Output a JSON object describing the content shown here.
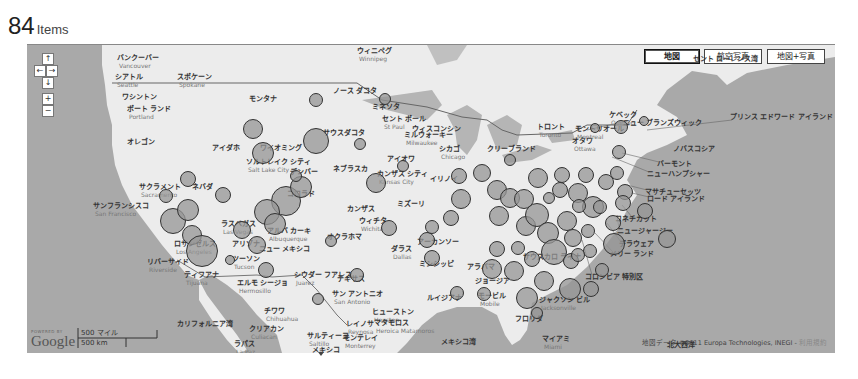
{
  "header": {
    "count": "84",
    "unit": "Items"
  },
  "map_controls": {
    "pan_up": "↑",
    "pan_left": "←",
    "pan_right": "→",
    "pan_down": "↓",
    "zoom_in": "+",
    "zoom_out": "−"
  },
  "map_types": [
    {
      "label": "地図",
      "active": true
    },
    {
      "label": "航空写真",
      "active": false
    },
    {
      "label": "地図+写真",
      "active": false
    }
  ],
  "labels": [
    {
      "text": "ウィニペグ",
      "sub": "Winnipeg",
      "x": 330,
      "y": 2
    },
    {
      "text": "バンクーバー",
      "sub": "Vancouver",
      "x": 90,
      "y": 9
    },
    {
      "text": "シアトル",
      "sub": "Seattle",
      "x": 88,
      "y": 28
    },
    {
      "text": "スポケーン",
      "sub": "Spokane",
      "x": 150,
      "y": 28
    },
    {
      "text": "ワシントン",
      "x": 95,
      "y": 48
    },
    {
      "text": "ポート ランド",
      "sub": "Portland",
      "x": 100,
      "y": 60
    },
    {
      "text": "オレゴン",
      "x": 100,
      "y": 93
    },
    {
      "text": "モンタナ",
      "x": 222,
      "y": 50
    },
    {
      "text": "アイダホ",
      "x": 185,
      "y": 99
    },
    {
      "text": "ワイオミング",
      "x": 233,
      "y": 99
    },
    {
      "text": "ノース ダコタ",
      "x": 306,
      "y": 42
    },
    {
      "text": "サウスダコタ",
      "x": 296,
      "y": 84
    },
    {
      "text": "ミネソタ",
      "x": 345,
      "y": 58
    },
    {
      "text": "セント ポール",
      "sub": "St Paul",
      "x": 355,
      "y": 70
    },
    {
      "text": "ミルウォーキー",
      "sub": "Milwaukee",
      "x": 377,
      "y": 86
    },
    {
      "text": "ウィスコンシン",
      "x": 385,
      "y": 80
    },
    {
      "text": "アイオワ",
      "x": 360,
      "y": 110
    },
    {
      "text": "ネブラスカ",
      "x": 306,
      "y": 120
    },
    {
      "text": "ソルトレイク シティ",
      "sub": "Salt Lake City",
      "x": 219,
      "y": 113
    },
    {
      "text": "デンバー",
      "x": 263,
      "y": 123
    },
    {
      "text": "コロラド",
      "x": 260,
      "y": 145
    },
    {
      "text": "ネバダ",
      "x": 165,
      "y": 138
    },
    {
      "text": "サクラメント",
      "sub": "Sacramento",
      "x": 112,
      "y": 138
    },
    {
      "text": "サンフランシスコ",
      "sub": "San Francisco",
      "x": 66,
      "y": 157
    },
    {
      "text": "カンザス シティ",
      "sub": "Kansas City",
      "x": 350,
      "y": 125
    },
    {
      "text": "カンザス",
      "x": 320,
      "y": 160
    },
    {
      "text": "ウィチタ",
      "sub": "Wichita",
      "x": 332,
      "y": 172
    },
    {
      "text": "ミズーリ",
      "x": 370,
      "y": 155
    },
    {
      "text": "イリノイ",
      "x": 403,
      "y": 130
    },
    {
      "text": "シカゴ",
      "sub": "Chicago",
      "x": 412,
      "y": 100
    },
    {
      "text": "クリーブランド",
      "x": 460,
      "y": 100
    },
    {
      "text": "トロント",
      "sub": "Toronto",
      "x": 510,
      "y": 78
    },
    {
      "text": "オタワ",
      "sub": "Ottawa",
      "x": 545,
      "y": 92
    },
    {
      "text": "モントリオール",
      "sub": "Montreal",
      "x": 548,
      "y": 80
    },
    {
      "text": "ケベック",
      "sub": "Quebec",
      "x": 582,
      "y": 66
    },
    {
      "text": "セント ローレンス湾",
      "x": 666,
      "y": 10
    },
    {
      "text": "ニュー ブランズウィック",
      "x": 596,
      "y": 74
    },
    {
      "text": "プリンス エドワード アイランド",
      "x": 703,
      "y": 68
    },
    {
      "text": "ノバスコシア",
      "x": 646,
      "y": 100
    },
    {
      "text": "バーモント",
      "x": 630,
      "y": 115
    },
    {
      "text": "ニューハンプシャー",
      "x": 620,
      "y": 125
    },
    {
      "text": "マサチューセッツ",
      "x": 618,
      "y": 143
    },
    {
      "text": "ロード アイランド",
      "x": 620,
      "y": 150
    },
    {
      "text": "コネチカット",
      "x": 588,
      "y": 170
    },
    {
      "text": "ニュージャージー",
      "x": 590,
      "y": 182
    },
    {
      "text": "デラウェア",
      "x": 592,
      "y": 195
    },
    {
      "text": "メリー ランド",
      "x": 583,
      "y": 205
    },
    {
      "text": "コロンビア 特別区",
      "x": 558,
      "y": 228
    },
    {
      "text": "オクラホマ",
      "x": 300,
      "y": 188
    },
    {
      "text": "アーカンソー",
      "x": 390,
      "y": 193
    },
    {
      "text": "ミシシッピ",
      "x": 392,
      "y": 215
    },
    {
      "text": "アラバマ",
      "x": 440,
      "y": 218
    },
    {
      "text": "サウスカロ ライナ",
      "x": 496,
      "y": 208
    },
    {
      "text": "ジョージア",
      "x": 448,
      "y": 232
    },
    {
      "text": "ダラス",
      "sub": "Dallas",
      "x": 364,
      "y": 200
    },
    {
      "text": "テキサス",
      "x": 310,
      "y": 230
    },
    {
      "text": "ルイジアナ",
      "x": 400,
      "y": 249
    },
    {
      "text": "モービル",
      "sub": "Mobile",
      "x": 451,
      "y": 247
    },
    {
      "text": "ジャクソン ビル",
      "sub": "Jacksonville",
      "x": 512,
      "y": 251
    },
    {
      "text": "フロリダ",
      "x": 488,
      "y": 270
    },
    {
      "text": "マイアミ",
      "sub": "Miami",
      "x": 515,
      "y": 290
    },
    {
      "text": "北大西洋",
      "x": 640,
      "y": 296
    },
    {
      "text": "メキシコ湾",
      "x": 414,
      "y": 293
    },
    {
      "text": "ヒューストン",
      "sub": "Houston",
      "x": 345,
      "y": 263
    },
    {
      "text": "マタモロス",
      "sub": "Heroica Matamoros",
      "x": 347,
      "y": 274
    },
    {
      "text": "サン アントニオ",
      "sub": "San Antonio",
      "x": 305,
      "y": 245
    },
    {
      "text": "レイノサ",
      "sub": "Reynosa",
      "x": 319,
      "y": 275
    },
    {
      "text": "モンテレイ",
      "sub": "Monterrey",
      "x": 316,
      "y": 289
    },
    {
      "text": "サルティーヨ",
      "sub": "Saltillo",
      "x": 280,
      "y": 287
    },
    {
      "text": "メキシコ",
      "x": 285,
      "y": 301
    },
    {
      "text": "シウダー フアレス",
      "sub": "Juarez",
      "x": 267,
      "y": 226
    },
    {
      "text": "ニュー メキシコ",
      "x": 232,
      "y": 200
    },
    {
      "text": "アルバ カーキ",
      "sub": "Albuquerque",
      "x": 240,
      "y": 182
    },
    {
      "text": "アリゾナ",
      "x": 205,
      "y": 195
    },
    {
      "text": "ツーソン",
      "sub": "Tucson",
      "x": 205,
      "y": 210
    },
    {
      "text": "ラスベガス",
      "sub": "Las Vegas",
      "x": 194,
      "y": 175
    },
    {
      "text": "ロサンゼルス",
      "sub": "Los Angeles",
      "x": 147,
      "y": 195
    },
    {
      "text": "リバーサイド",
      "sub": "Riverside",
      "x": 120,
      "y": 213
    },
    {
      "text": "ティフアナ",
      "sub": "Tijuana",
      "x": 157,
      "y": 226
    },
    {
      "text": "エルモ シージョ",
      "sub": "Hermosillo",
      "x": 210,
      "y": 234
    },
    {
      "text": "チワワ",
      "sub": "Chihuahua",
      "x": 237,
      "y": 262
    },
    {
      "text": "カリフォルニア湾",
      "x": 150,
      "y": 275
    },
    {
      "text": "クリアカン",
      "sub": "Culiacan",
      "x": 222,
      "y": 280
    },
    {
      "text": "ラパス",
      "sub": "La Paz",
      "x": 207,
      "y": 295
    }
  ],
  "bubbles": [
    {
      "x": 289,
      "y": 55,
      "r": 7
    },
    {
      "x": 226,
      "y": 84,
      "r": 10
    },
    {
      "x": 289,
      "y": 96,
      "r": 13
    },
    {
      "x": 236,
      "y": 108,
      "r": 11
    },
    {
      "x": 161,
      "y": 134,
      "r": 8
    },
    {
      "x": 196,
      "y": 150,
      "r": 8
    },
    {
      "x": 259,
      "y": 156,
      "r": 15
    },
    {
      "x": 240,
      "y": 167,
      "r": 13
    },
    {
      "x": 274,
      "y": 142,
      "r": 11
    },
    {
      "x": 248,
      "y": 179,
      "r": 11
    },
    {
      "x": 269,
      "y": 131,
      "r": 6
    },
    {
      "x": 146,
      "y": 176,
      "r": 13
    },
    {
      "x": 139,
      "y": 151,
      "r": 7
    },
    {
      "x": 161,
      "y": 165,
      "r": 11
    },
    {
      "x": 165,
      "y": 190,
      "r": 10
    },
    {
      "x": 175,
      "y": 206,
      "r": 16
    },
    {
      "x": 215,
      "y": 185,
      "r": 9
    },
    {
      "x": 230,
      "y": 200,
      "r": 9
    },
    {
      "x": 239,
      "y": 225,
      "r": 8
    },
    {
      "x": 304,
      "y": 196,
      "r": 6
    },
    {
      "x": 333,
      "y": 99,
      "r": 6
    },
    {
      "x": 349,
      "y": 138,
      "r": 10
    },
    {
      "x": 358,
      "y": 54,
      "r": 6
    },
    {
      "x": 376,
      "y": 121,
      "r": 6
    },
    {
      "x": 362,
      "y": 183,
      "r": 8
    },
    {
      "x": 400,
      "y": 195,
      "r": 8
    },
    {
      "x": 405,
      "y": 213,
      "r": 8
    },
    {
      "x": 405,
      "y": 182,
      "r": 7
    },
    {
      "x": 424,
      "y": 173,
      "r": 8
    },
    {
      "x": 432,
      "y": 131,
      "r": 8
    },
    {
      "x": 434,
      "y": 154,
      "r": 10
    },
    {
      "x": 455,
      "y": 128,
      "r": 9
    },
    {
      "x": 470,
      "y": 145,
      "r": 10
    },
    {
      "x": 483,
      "y": 153,
      "r": 10
    },
    {
      "x": 472,
      "y": 171,
      "r": 10
    },
    {
      "x": 497,
      "y": 154,
      "r": 10
    },
    {
      "x": 499,
      "y": 181,
      "r": 10
    },
    {
      "x": 510,
      "y": 170,
      "r": 12
    },
    {
      "x": 521,
      "y": 188,
      "r": 11
    },
    {
      "x": 540,
      "y": 176,
      "r": 10
    },
    {
      "x": 527,
      "y": 207,
      "r": 13
    },
    {
      "x": 544,
      "y": 216,
      "r": 8
    },
    {
      "x": 535,
      "y": 130,
      "r": 8
    },
    {
      "x": 559,
      "y": 130,
      "r": 8
    },
    {
      "x": 566,
      "y": 162,
      "r": 11
    },
    {
      "x": 586,
      "y": 178,
      "r": 8
    },
    {
      "x": 587,
      "y": 199,
      "r": 11
    },
    {
      "x": 564,
      "y": 244,
      "r": 8
    },
    {
      "x": 543,
      "y": 244,
      "r": 11
    },
    {
      "x": 517,
      "y": 236,
      "r": 10
    },
    {
      "x": 500,
      "y": 253,
      "r": 11
    },
    {
      "x": 487,
      "y": 226,
      "r": 10
    },
    {
      "x": 465,
      "y": 224,
      "r": 10
    },
    {
      "x": 470,
      "y": 204,
      "r": 8
    },
    {
      "x": 491,
      "y": 203,
      "r": 7
    },
    {
      "x": 505,
      "y": 214,
      "r": 8
    },
    {
      "x": 511,
      "y": 133,
      "r": 10
    },
    {
      "x": 533,
      "y": 145,
      "r": 8
    },
    {
      "x": 551,
      "y": 148,
      "r": 10
    },
    {
      "x": 561,
      "y": 186,
      "r": 7
    },
    {
      "x": 579,
      "y": 137,
      "r": 8
    },
    {
      "x": 590,
      "y": 128,
      "r": 7
    },
    {
      "x": 592,
      "y": 107,
      "r": 7
    },
    {
      "x": 594,
      "y": 82,
      "r": 7
    },
    {
      "x": 598,
      "y": 147,
      "r": 8
    },
    {
      "x": 596,
      "y": 158,
      "r": 8
    },
    {
      "x": 552,
      "y": 161,
      "r": 7
    },
    {
      "x": 573,
      "y": 162,
      "r": 7
    },
    {
      "x": 546,
      "y": 193,
      "r": 9
    },
    {
      "x": 563,
      "y": 206,
      "r": 7
    },
    {
      "x": 575,
      "y": 225,
      "r": 7
    },
    {
      "x": 551,
      "y": 210,
      "r": 7
    },
    {
      "x": 522,
      "y": 153,
      "r": 6
    },
    {
      "x": 618,
      "y": 166,
      "r": 8
    },
    {
      "x": 640,
      "y": 194,
      "r": 9
    },
    {
      "x": 617,
      "y": 76,
      "r": 5
    },
    {
      "x": 568,
      "y": 83,
      "r": 5
    },
    {
      "x": 457,
      "y": 249,
      "r": 7
    },
    {
      "x": 510,
      "y": 268,
      "r": 6
    },
    {
      "x": 483,
      "y": 115,
      "r": 6
    },
    {
      "x": 330,
      "y": 230,
      "r": 7
    },
    {
      "x": 430,
      "y": 248,
      "r": 7
    },
    {
      "x": 203,
      "y": 215,
      "r": 5
    },
    {
      "x": 291,
      "y": 254,
      "r": 6
    }
  ],
  "footer": {
    "powered_by": "POWERED BY",
    "google": "Google",
    "scale_miles": "500 マイル",
    "scale_km": "500 km",
    "attribution": "地図データ ©2011 Europa Technologies, INEGI - ",
    "terms_link": "利用規約"
  },
  "colors": {
    "water": "#a9a9a9",
    "land": "#ececec",
    "bubble_fill": "#969696",
    "bubble_stroke": "#333333"
  }
}
